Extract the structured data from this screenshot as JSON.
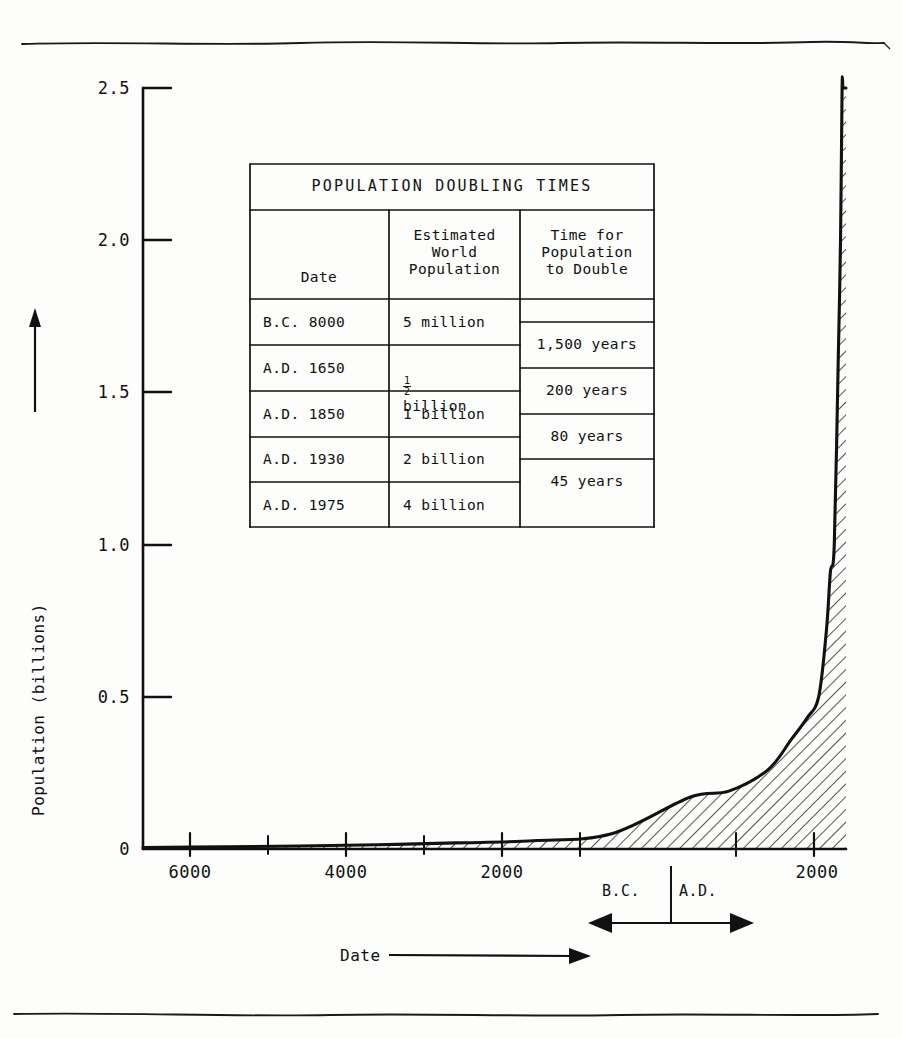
{
  "chart_data": {
    "type": "area",
    "title": "",
    "xlabel": "Date",
    "ylabel": "Population (billions)",
    "xlim": [
      -7000,
      2000
    ],
    "ylim": [
      0,
      2.5
    ],
    "y_ticks": [
      "0",
      "0.5",
      "1.0",
      "1.5",
      "2.0",
      "2.5"
    ],
    "y_tick_values": [
      0,
      0.5,
      1.0,
      1.5,
      2.0,
      2.5
    ],
    "x_ticks": [
      "6000",
      "4000",
      "2000",
      "2000"
    ],
    "x_tick_values": [
      -6000,
      -4000,
      -2000,
      2000
    ],
    "x_minor_tick_values": [
      -5000,
      -3000,
      -1000,
      1000
    ],
    "grid": false,
    "legend": false,
    "fill_pattern": "diagonal-hatch",
    "series": [
      {
        "name": "World population",
        "x": [
          -7000,
          -6000,
          -5000,
          -4000,
          -3000,
          -2000,
          -1000,
          0,
          500,
          1000,
          1300,
          1500,
          1650,
          1750,
          1800,
          1850,
          1900,
          1930,
          1950,
          1960,
          1970,
          1975,
          1980,
          1990,
          2000
        ],
        "y": [
          0.005,
          0.007,
          0.01,
          0.014,
          0.02,
          0.027,
          0.05,
          0.17,
          0.19,
          0.26,
          0.36,
          0.43,
          0.5,
          0.72,
          0.91,
          1.0,
          1.6,
          2.0,
          2.5,
          2.5,
          2.5,
          2.5,
          2.5,
          2.5,
          2.5
        ]
      }
    ],
    "annotations": [
      {
        "name": "era-divider",
        "label_left": "B.C.",
        "label_right": "A.D.",
        "at_x": 0
      }
    ]
  },
  "axes": {
    "y_title": "Population (billions)",
    "x_title": "Date",
    "y_tick_labels": [
      "2.5",
      "2.0",
      "1.5",
      "1.0",
      "0.5",
      "0"
    ],
    "x_tick_labels": [
      "6000",
      "4000",
      "2000",
      "2000"
    ]
  },
  "era_annotation": {
    "bc": "B.C.",
    "ad": "A.D."
  },
  "table": {
    "title": "POPULATION DOUBLING TIMES",
    "headers": {
      "date": "Date",
      "population": "Estimated\nWorld\nPopulation",
      "doubling": "Time for\nPopulation\nto Double"
    },
    "rows": [
      {
        "date": "B.C. 8000",
        "population": "5 million"
      },
      {
        "date": "A.D. 1650",
        "population": "billion",
        "population_fraction": "1/2"
      },
      {
        "date": "A.D. 1850",
        "population": "1 billion"
      },
      {
        "date": "A.D. 1930",
        "population": "2 billion"
      },
      {
        "date": "A.D. 1975",
        "population": "4 billion"
      }
    ],
    "doubling_times": [
      "1,500 years",
      "200 years",
      "80 years",
      "45 years"
    ]
  }
}
